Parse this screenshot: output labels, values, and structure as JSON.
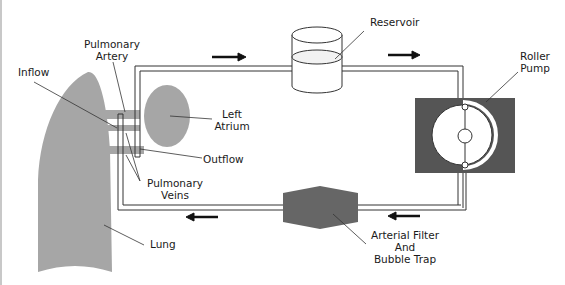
{
  "diagram": {
    "colors": {
      "tissue": "#a6a6a6",
      "device_dark": "#555555",
      "filter": "#666666",
      "line": "#333333",
      "background": "#ffffff"
    },
    "labels": {
      "pulmonary_artery_line1": "Pulmonary",
      "pulmonary_artery_line2": "Artery",
      "inflow": "Inflow",
      "left_atrium_line1": "Left",
      "left_atrium_line2": "Atrium",
      "outflow": "Outflow",
      "pulmonary_veins_line1": "Pulmonary",
      "pulmonary_veins_line2": "Veins",
      "lung": "Lung",
      "reservoir": "Reservoir",
      "roller_pump_line1": "Roller",
      "roller_pump_line2": "Pump",
      "filter_line1": "Arterial Filter",
      "filter_line2": "And",
      "filter_line3": "Bubble Trap"
    },
    "flow_arrows": [
      {
        "position": "top-left",
        "direction": "right"
      },
      {
        "position": "top-right",
        "direction": "right"
      },
      {
        "position": "bottom-right",
        "direction": "left"
      },
      {
        "position": "bottom-left",
        "direction": "left"
      }
    ]
  }
}
